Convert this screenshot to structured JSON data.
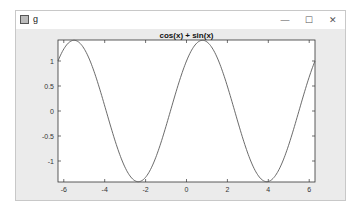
{
  "window": {
    "title": "g",
    "controls": {
      "minimize": "—",
      "maximize": "☐",
      "close": "✕"
    }
  },
  "chart_data": {
    "type": "line",
    "title": "cos(x) + sin(x)",
    "xlabel": "",
    "ylabel": "",
    "xlim": [
      -6.2832,
      6.2832
    ],
    "ylim": [
      -1.42,
      1.42
    ],
    "xticks": [
      -6,
      -4,
      -2,
      0,
      2,
      4,
      6
    ],
    "yticks": [
      1,
      0.5,
      0,
      -0.5,
      -1
    ],
    "xtick_labels": [
      "-6",
      "-4",
      "-2",
      "0",
      "2",
      "4",
      "6"
    ],
    "ytick_labels": [
      "1",
      "0.5",
      "0",
      "-0.5",
      "-1"
    ],
    "grid": false,
    "legend": null,
    "series": [
      {
        "name": "cos(x) + sin(x)",
        "function": "cos(x)+sin(x)",
        "color": "#5a5a5a",
        "x_range": [
          -6.2832,
          6.2832
        ],
        "key_points": [
          {
            "x": -6.2832,
            "y": 1.0
          },
          {
            "x": -5.4978,
            "y": 1.4142
          },
          {
            "x": -2.3562,
            "y": -1.4142
          },
          {
            "x": 0,
            "y": 1.0
          },
          {
            "x": 0.7854,
            "y": 1.4142
          },
          {
            "x": 3.927,
            "y": -1.4142
          },
          {
            "x": 6.2832,
            "y": 1.0
          }
        ]
      }
    ]
  },
  "colors": {
    "axes_bg": "#ffffff",
    "figure_bg": "#ebebeb",
    "line": "#5a5a5a",
    "axis": "#333333"
  }
}
